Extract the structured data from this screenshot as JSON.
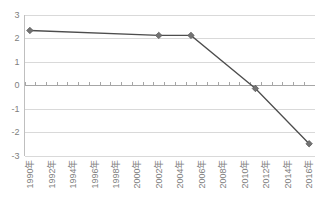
{
  "chart_data": {
    "type": "line",
    "title": "",
    "subtitle": "",
    "xlabel": "",
    "ylabel": "",
    "ylim": [
      -3,
      3
    ],
    "y_ticks": [
      3,
      2,
      1,
      0,
      -1,
      -2,
      -3
    ],
    "y_tick_labels": [
      "3",
      "2",
      "1",
      "0",
      "-1",
      "-2",
      "-3"
    ],
    "grid": true,
    "legend": false,
    "legend_position": "none",
    "category_axis_at_zero": true,
    "x_tick_labels": [
      "1990年",
      "1992年",
      "1994年",
      "1996年",
      "1998年",
      "2000年",
      "2002年",
      "2004年",
      "2006年",
      "2008年",
      "2010年",
      "2012年",
      "2014年",
      "2016年"
    ],
    "x_tick_rotation": -90,
    "categories": [
      "1990年",
      "1991年",
      "1992年",
      "1993年",
      "1994年",
      "1995年",
      "1996年",
      "1997年",
      "1998年",
      "1999年",
      "2000年",
      "2001年",
      "2002年",
      "2003年",
      "2004年",
      "2005年",
      "2006年",
      "2007年",
      "2008年",
      "2009年",
      "2010年",
      "2011年",
      "2012年",
      "2013年",
      "2014年",
      "2015年",
      "2016年"
    ],
    "series": [
      {
        "name": "",
        "marker": "diamond",
        "color": "#4d4d4d",
        "marker_color": "#737373",
        "points": [
          {
            "x": "1990年",
            "y": 2.32
          },
          {
            "x": "2002年",
            "y": 2.11
          },
          {
            "x": "2005年",
            "y": 2.11
          },
          {
            "x": "2011年",
            "y": -0.15
          },
          {
            "x": "2016年",
            "y": -2.5
          }
        ]
      }
    ]
  },
  "colors": {
    "series_line": "#4d4d4d",
    "marker_fill": "#737373",
    "gridline": "#d9d9d9",
    "axis": "#bfbfbf",
    "tick_label": "#808080",
    "background": "#ffffff"
  }
}
